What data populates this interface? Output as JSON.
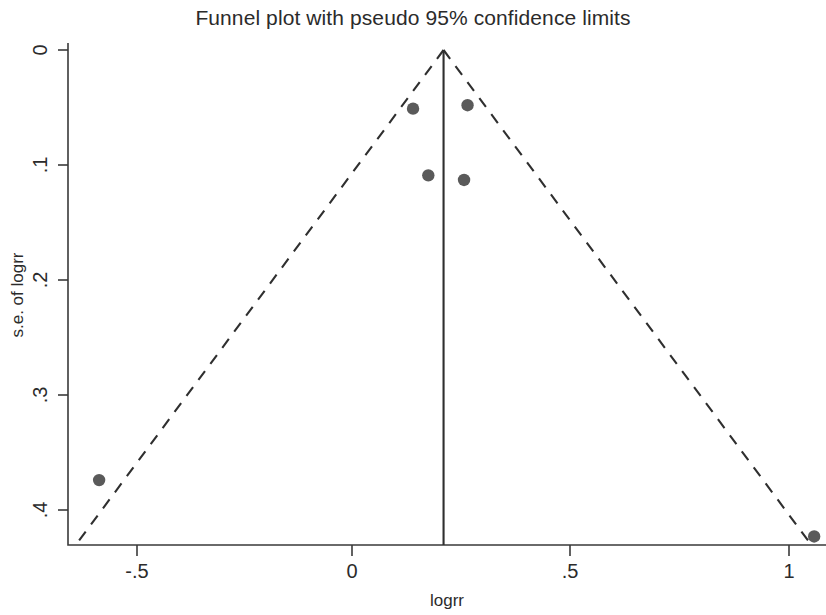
{
  "chart_data": {
    "type": "scatter",
    "title": "Funnel plot with pseudo 95% confidence limits",
    "xlabel": "logrr",
    "ylabel": "s.e. of logrr",
    "xlim": [
      -0.65,
      1.12
    ],
    "ylim": [
      0.432,
      -0.008
    ],
    "y_axis_inverted": true,
    "grid": false,
    "legend": null,
    "xticks": [
      -0.5,
      0,
      0.5,
      1
    ],
    "xtick_labels": [
      "-.5",
      "0",
      ".5",
      "1"
    ],
    "yticks": [
      0,
      0.1,
      0.2,
      0.3,
      0.4
    ],
    "ytick_labels": [
      "0",
      ".1",
      ".2",
      ".3",
      ".4"
    ],
    "marker_color": "#5a5a5a",
    "line_color": "#2f2f2f",
    "pooled_effect": 0.21,
    "center_line_label": "pooled logrr",
    "pseudo_ci_multiplier": 1.96,
    "points": [
      {
        "x": -0.58,
        "y": 0.374
      },
      {
        "x": 0.14,
        "y": 0.051
      },
      {
        "x": 0.265,
        "y": 0.048
      },
      {
        "x": 0.175,
        "y": 0.109
      },
      {
        "x": 0.257,
        "y": 0.113
      },
      {
        "x": 1.06,
        "y": 0.423
      }
    ],
    "series": [
      {
        "name": "studies",
        "x": [
          -0.58,
          0.14,
          0.265,
          0.175,
          0.257,
          1.06
        ],
        "values": [
          0.374,
          0.051,
          0.048,
          0.109,
          0.113,
          0.423
        ]
      }
    ]
  }
}
